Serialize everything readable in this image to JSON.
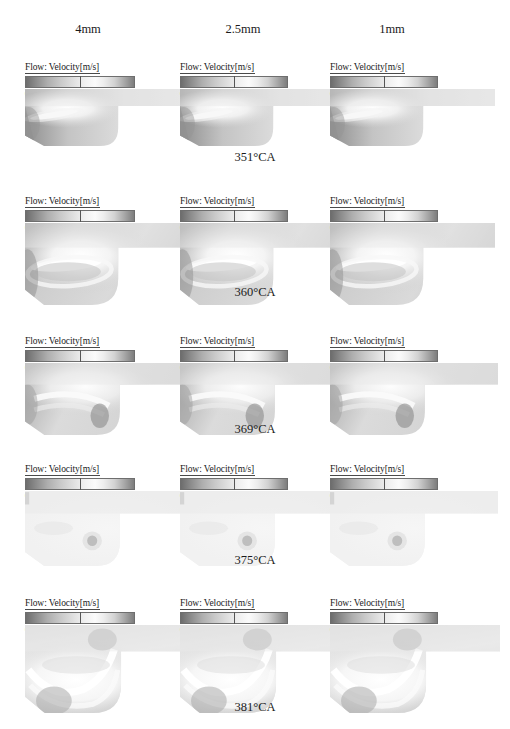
{
  "figure": {
    "columns": [
      {
        "label": "4mm"
      },
      {
        "label": "2.5mm"
      },
      {
        "label": "1mm"
      }
    ],
    "colorbar_title": "Flow: Velocity[m/s]",
    "rows": [
      {
        "caption": "351°CA",
        "panels": [
          {
            "column": "4mm",
            "min": "0",
            "mid": "37.95",
            "max": "75.91"
          },
          {
            "column": "2.5mm",
            "min": "0",
            "mid": "40.89",
            "max": "81.78"
          },
          {
            "column": "1mm",
            "min": "0",
            "mid": "40.88",
            "max": "81.75"
          }
        ]
      },
      {
        "caption": "360°CA",
        "panels": [
          {
            "column": "4mm",
            "min": "0",
            "mid": "50.75",
            "max": "101.5"
          },
          {
            "column": "2.5mm",
            "min": "0",
            "mid": "52.35",
            "max": "104.7"
          },
          {
            "column": "1mm",
            "min": "0",
            "mid": "59.47",
            "max": "118.9"
          }
        ]
      },
      {
        "caption": "369°CA",
        "panels": [
          {
            "column": "4mm",
            "min": "0",
            "mid": "33.76",
            "max": "67.53"
          },
          {
            "column": "2.5mm",
            "min": "0",
            "mid": "38.63",
            "max": "77.26"
          },
          {
            "column": "1mm",
            "min": "0",
            "mid": "39.73",
            "max": "79.46"
          }
        ]
      },
      {
        "caption": "375°CA",
        "panels": [
          {
            "column": "4mm",
            "min": "0",
            "mid": "18.15",
            "max": "36.3"
          },
          {
            "column": "2.5mm",
            "min": "0",
            "mid": "18.5",
            "max": "37"
          },
          {
            "column": "1mm",
            "min": "0",
            "mid": "19.76",
            "max": "39.53"
          }
        ]
      },
      {
        "caption": "381°CA",
        "panels": [
          {
            "column": "4mm",
            "min": "0",
            "mid": "11.85",
            "max": "23.71"
          },
          {
            "column": "2.5mm",
            "min": "0",
            "mid": "12.62",
            "max": "25.24"
          },
          {
            "column": "1mm",
            "min": "0",
            "mid": "14.63",
            "max": "29.25"
          }
        ]
      }
    ]
  },
  "chart_data": {
    "type": "heatmap",
    "colormap": "grayscale (dark-light-dark)",
    "value_unit": "m/s",
    "colorbar_label": "Flow: Velocity[m/s]",
    "grid_rows": 5,
    "grid_cols": 3,
    "col_categories": [
      "4mm",
      "2.5mm",
      "1mm"
    ],
    "row_categories": [
      "351°CA",
      "360°CA",
      "369°CA",
      "375°CA",
      "381°CA"
    ],
    "panels": [
      {
        "row": "351°CA",
        "col": "4mm",
        "vmin": 0,
        "vmid": 37.95,
        "vmax": 75.91
      },
      {
        "row": "351°CA",
        "col": "2.5mm",
        "vmin": 0,
        "vmid": 40.89,
        "vmax": 81.78
      },
      {
        "row": "351°CA",
        "col": "1mm",
        "vmin": 0,
        "vmid": 40.88,
        "vmax": 81.75
      },
      {
        "row": "360°CA",
        "col": "4mm",
        "vmin": 0,
        "vmid": 50.75,
        "vmax": 101.5
      },
      {
        "row": "360°CA",
        "col": "2.5mm",
        "vmin": 0,
        "vmid": 52.35,
        "vmax": 104.7
      },
      {
        "row": "360°CA",
        "col": "1mm",
        "vmin": 0,
        "vmid": 59.47,
        "vmax": 118.9
      },
      {
        "row": "369°CA",
        "col": "4mm",
        "vmin": 0,
        "vmid": 33.76,
        "vmax": 67.53
      },
      {
        "row": "369°CA",
        "col": "2.5mm",
        "vmin": 0,
        "vmid": 38.63,
        "vmax": 77.26
      },
      {
        "row": "369°CA",
        "col": "1mm",
        "vmin": 0,
        "vmid": 39.73,
        "vmax": 79.46
      },
      {
        "row": "375°CA",
        "col": "4mm",
        "vmin": 0,
        "vmid": 18.15,
        "vmax": 36.3
      },
      {
        "row": "375°CA",
        "col": "2.5mm",
        "vmin": 0,
        "vmid": 18.5,
        "vmax": 37
      },
      {
        "row": "375°CA",
        "col": "1mm",
        "vmin": 0,
        "vmid": 19.76,
        "vmax": 39.53
      },
      {
        "row": "381°CA",
        "col": "4mm",
        "vmin": 0,
        "vmid": 11.85,
        "vmax": 23.71
      },
      {
        "row": "381°CA",
        "col": "2.5mm",
        "vmin": 0,
        "vmid": 12.62,
        "vmax": 25.24
      },
      {
        "row": "381°CA",
        "col": "1mm",
        "vmin": 0,
        "vmid": 14.63,
        "vmax": 29.25
      }
    ]
  }
}
